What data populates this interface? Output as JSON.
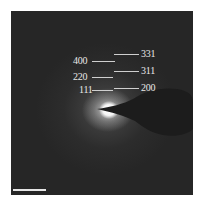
{
  "figure": {
    "type": "selected-area electron diffraction pattern",
    "left_labels": [
      {
        "text": "400"
      },
      {
        "text": "220"
      },
      {
        "text": "111"
      }
    ],
    "right_labels": [
      {
        "text": "331"
      },
      {
        "text": "311"
      },
      {
        "text": "200"
      }
    ],
    "scale_bar": {
      "label": ""
    },
    "colors": {
      "background": "#262626",
      "label": "#e8e8e8",
      "beamstop": "#1a1a1a"
    }
  }
}
